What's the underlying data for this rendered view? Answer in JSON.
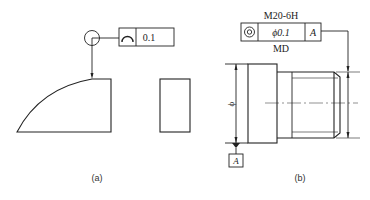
{
  "figure_a": {
    "caption": "(a)",
    "tolerance_frame": {
      "symbol": "profile-of-a-line-icon",
      "value": "0.1"
    }
  },
  "figure_b": {
    "caption": "(b)",
    "tolerance_frame": {
      "top_label": "M20-6H",
      "symbol": "concentricity-icon",
      "value": "ϕ0.1",
      "datum": "A",
      "bottom_label": "MD"
    },
    "dimension_symbol": "ϕ",
    "datum_label": "A"
  },
  "colors": {
    "line": "#222222",
    "background": "#ffffff"
  }
}
